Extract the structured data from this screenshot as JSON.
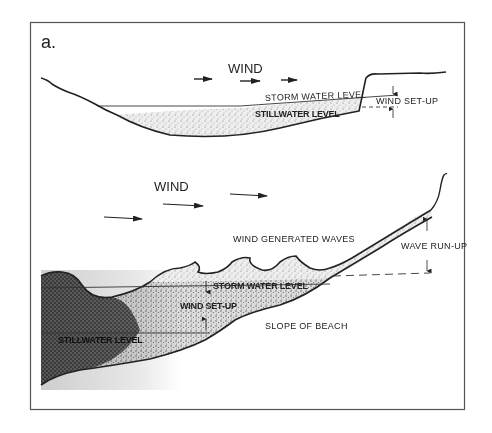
{
  "figure": {
    "panel_label": "a.",
    "frame_color": "#555555",
    "ink_color": "#222222",
    "top_panel": {
      "title": "Lake / enclosed basin wind set-up",
      "wind_label": "WIND",
      "storm_water_level_label": "STORM WATER LEVEL",
      "stillwater_level_label": "STILLWATER LEVEL",
      "wind_setup_label": "WIND SET-UP",
      "wind_arrows": 3
    },
    "bottom_panel": {
      "title": "Beach with wind generated waves",
      "wind_label": "WIND",
      "wind_generated_waves_label": "WIND GENERATED WAVES",
      "wave_runup_label": "WAVE RUN-UP",
      "storm_water_level_label": "STORM WATER LEVEL",
      "wind_setup_label": "WIND SET-UP",
      "stillwater_level_label": "STILLWATER LEVEL",
      "slope_of_beach_label": "SLOPE OF BEACH",
      "wind_arrows": 3
    }
  }
}
